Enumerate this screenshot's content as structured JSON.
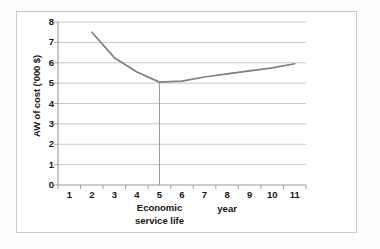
{
  "chart_data": {
    "type": "line",
    "title": "",
    "subtitle": "",
    "xlabel": "year",
    "ylabel": "AW of cost ('000 $)",
    "categories": [
      1,
      2,
      3,
      4,
      5,
      6,
      7,
      8,
      9,
      10,
      11
    ],
    "x_tick_labels": [
      "1",
      "2",
      "3",
      "4",
      "5",
      "6",
      "7",
      "8",
      "9",
      "10",
      "11"
    ],
    "y_tick_labels": [
      "0",
      "1",
      "2",
      "3",
      "4",
      "5",
      "6",
      "7",
      "8"
    ],
    "ylim": [
      0,
      8
    ],
    "y_major_step": 1,
    "grid": "horizontal",
    "legend": "none",
    "line_color": "#808080",
    "series": [
      {
        "name": "AW of cost",
        "x": [
          2,
          3,
          4,
          5,
          6,
          7,
          8,
          9,
          10,
          11
        ],
        "values": [
          7.5,
          6.25,
          5.55,
          5.05,
          5.1,
          5.3,
          5.45,
          5.6,
          5.75,
          5.95
        ]
      }
    ],
    "annotations": [
      {
        "name": "economic-service-life",
        "text": "Economic\nservice life",
        "line1": "Economic",
        "line2": "service life",
        "at_x": 5,
        "at_y": 5.05,
        "marker": "vertical drop line from curve minimum to y = 0"
      }
    ]
  },
  "axes": {
    "y_title": "AW of cost ('000 $)",
    "x_title": "year"
  }
}
